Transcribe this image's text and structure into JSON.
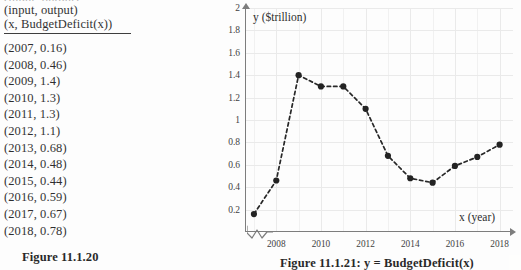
{
  "page": {
    "cut_top_text": "(input, output)"
  },
  "table": {
    "header_line_1": "(input, output)",
    "header_line_2": "(x, BudgetDeficit(x))",
    "rows": [
      "(2007, 0.16)",
      "(2008, 0.46)",
      "(2009, 1.4)",
      "(2010, 1.3)",
      "(2011, 1.3)",
      "(2012, 1.1)",
      "(2013, 0.68)",
      "(2014, 0.48)",
      "(2015, 0.44)",
      "(2016, 0.59)",
      "(2017, 0.67)",
      "(2018, 0.78)"
    ],
    "caption": "Figure 11.1.20"
  },
  "figure": {
    "caption": "Figure 11.1.21: y = BudgetDeficit(x)"
  },
  "chart_data": {
    "type": "line",
    "title": "",
    "xlabel": "x (year)",
    "ylabel": "y ($trillion)",
    "x": [
      2007,
      2008,
      2009,
      2010,
      2011,
      2012,
      2013,
      2014,
      2015,
      2016,
      2017,
      2018
    ],
    "values": [
      0.16,
      0.46,
      1.4,
      1.3,
      1.3,
      1.1,
      0.68,
      0.48,
      0.44,
      0.59,
      0.67,
      0.78
    ],
    "xlim": [
      2006.6,
      2018.6
    ],
    "ylim": [
      0,
      2
    ],
    "y_ticks": [
      0.2,
      0.4,
      0.6,
      0.8,
      1,
      1.2,
      1.4,
      1.6,
      1.8,
      2
    ],
    "y_tick_labels": [
      "0.2",
      "0.4",
      "0.6",
      "0.8",
      "1",
      "1.2",
      "1.4",
      "1.6",
      "1.8",
      "2"
    ],
    "x_ticks": [
      2008,
      2010,
      2012,
      2014,
      2016,
      2018
    ],
    "x_tick_labels": [
      "2008",
      "2010",
      "2012",
      "2014",
      "2016",
      "2018"
    ],
    "grid": true,
    "legend": "none",
    "line_style": "dashed",
    "marker": "filled-circle",
    "axis_break": true,
    "colors": {
      "line": "#111111",
      "marker": "#0c0c0c",
      "axis": "#707070",
      "grid": "#e9e9e9",
      "text": "#181818"
    }
  }
}
